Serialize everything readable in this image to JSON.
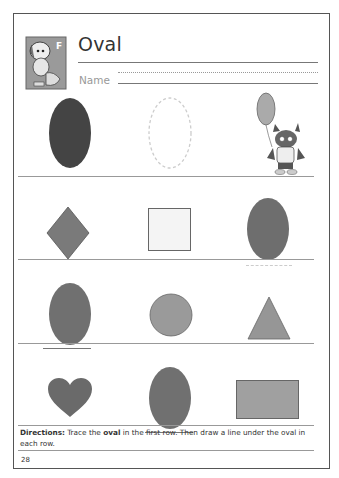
{
  "worksheet": {
    "title": "Oval",
    "name_label": "Name",
    "rows": [
      {
        "shapes": [
          {
            "shape": "oval",
            "fill": "#444444",
            "style": "solid"
          },
          {
            "shape": "oval",
            "fill": "none",
            "style": "dashed-trace"
          },
          {
            "shape": "mascot-with-balloon",
            "style": "illustration"
          }
        ]
      },
      {
        "shapes": [
          {
            "shape": "diamond",
            "fill": "#7a7a7a"
          },
          {
            "shape": "square",
            "fill": "#f4f4f4"
          },
          {
            "shape": "oval",
            "fill": "#6e6e6e",
            "underline": "dotted"
          }
        ]
      },
      {
        "shapes": [
          {
            "shape": "oval",
            "fill": "#707070",
            "underline": "solid"
          },
          {
            "shape": "circle",
            "fill": "#9a9a9a"
          },
          {
            "shape": "triangle",
            "fill": "#969696"
          }
        ]
      },
      {
        "shapes": [
          {
            "shape": "heart",
            "fill": "#6a6a6a"
          },
          {
            "shape": "oval",
            "fill": "#707070",
            "underline": "solid"
          },
          {
            "shape": "rectangle",
            "fill": "#a0a0a0"
          }
        ]
      }
    ],
    "directions": {
      "label": "Directions:",
      "text_1": " Trace the ",
      "bold_word": "oval",
      "text_2": " in the first row. Then draw a line under the oval in each row."
    },
    "page_number": "28"
  }
}
